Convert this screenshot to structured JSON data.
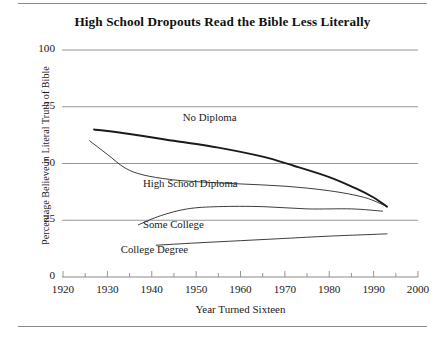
{
  "chart_data": {
    "type": "line",
    "title": "High School Dropouts Read the Bible Less Literally",
    "xlabel": "Year Turned Sixteen",
    "ylabel": "Percentage Believe in Literal Truth of Bible",
    "xlim": [
      1920,
      2000
    ],
    "ylim": [
      0,
      100
    ],
    "xticks": [
      "1920",
      "1930",
      "1940",
      "1950",
      "1960",
      "1970",
      "1980",
      "1990",
      "2000"
    ],
    "xtick_values": [
      1920,
      1930,
      1940,
      1950,
      1960,
      1970,
      1980,
      1990,
      2000
    ],
    "xminor_step": 5,
    "yticks": [
      "0",
      "25",
      "50",
      "75",
      "100"
    ],
    "ytick_values": [
      0,
      25,
      50,
      75,
      100
    ],
    "grid": "horizontal",
    "legend_position": "inline-labels",
    "line_color": "#1a1a1a",
    "grid_color": "#8a8a8a",
    "series": [
      {
        "name": "No Diploma",
        "label": "No Diploma",
        "emphasis": "thick",
        "label_x": 1947,
        "label_y": 70,
        "x": [
          1927,
          1935,
          1945,
          1955,
          1965,
          1972,
          1980,
          1986,
          1990,
          1993
        ],
        "values": [
          65,
          63,
          60,
          57,
          53,
          49,
          44,
          39,
          35,
          31
        ]
      },
      {
        "name": "High School Diploma",
        "label": "High School Diploma",
        "emphasis": "thin",
        "label_x": 1938,
        "label_y": 41,
        "x": [
          1926,
          1930,
          1934,
          1938,
          1944,
          1950,
          1960,
          1970,
          1980,
          1988,
          1993
        ],
        "values": [
          60,
          54,
          48,
          45,
          43,
          42,
          41,
          40,
          38,
          35,
          31
        ]
      },
      {
        "name": "Some College",
        "label": "Some College",
        "emphasis": "thin",
        "label_x": 1938,
        "label_y": 23,
        "x": [
          1937,
          1942,
          1948,
          1955,
          1965,
          1975,
          1985,
          1992
        ],
        "values": [
          23,
          27,
          30,
          31,
          31,
          30,
          30,
          29
        ]
      },
      {
        "name": "College Degree",
        "label": "College Degree",
        "emphasis": "thin",
        "label_x": 1933,
        "label_y": 12,
        "x": [
          1941,
          1950,
          1960,
          1970,
          1980,
          1993
        ],
        "values": [
          14,
          15,
          16,
          17,
          18,
          19
        ]
      }
    ]
  }
}
